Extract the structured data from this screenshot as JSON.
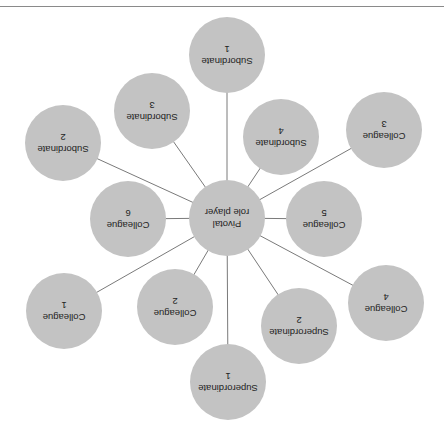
{
  "diagram": {
    "orientation": "rotated-180",
    "colors": {
      "node_fill": "#c3c3c3",
      "edge": "#7a7a7a",
      "text": "#222222",
      "rule": "#8a8a8a"
    },
    "center": {
      "line1": "Pivotal",
      "line2": "role player",
      "cx": 227,
      "cy": 218
    },
    "nodes": [
      {
        "id": "subordinate-1",
        "line1": "Subordinate",
        "line2": "1",
        "cx": 227,
        "cy": 55
      },
      {
        "id": "subordinate-2",
        "line1": "Subordinate",
        "line2": "2",
        "cx": 63,
        "cy": 143
      },
      {
        "id": "subordinate-3",
        "line1": "Subordinate",
        "line2": "3",
        "cx": 152,
        "cy": 111
      },
      {
        "id": "subordinate-4",
        "line1": "Subordinate",
        "line2": "4",
        "cx": 281,
        "cy": 137
      },
      {
        "id": "colleague-3",
        "line1": "Colleague",
        "line2": "3",
        "cx": 384,
        "cy": 130
      },
      {
        "id": "colleague-5",
        "line1": "Colleague",
        "line2": "5",
        "cx": 324,
        "cy": 219
      },
      {
        "id": "colleague-6",
        "line1": "Colleague",
        "line2": "6",
        "cx": 128,
        "cy": 219
      },
      {
        "id": "colleague-1",
        "line1": "Colleague",
        "line2": "1",
        "cx": 64,
        "cy": 311
      },
      {
        "id": "colleague-2",
        "line1": "Colleague",
        "line2": "2",
        "cx": 175,
        "cy": 307
      },
      {
        "id": "superordinate-1",
        "line1": "Superordinate",
        "line2": "1",
        "cx": 228,
        "cy": 382
      },
      {
        "id": "superordinate-2",
        "line1": "Superordinate",
        "line2": "2",
        "cx": 299,
        "cy": 326
      },
      {
        "id": "colleague-4",
        "line1": "Colleague",
        "line2": "4",
        "cx": 386,
        "cy": 303
      }
    ]
  }
}
